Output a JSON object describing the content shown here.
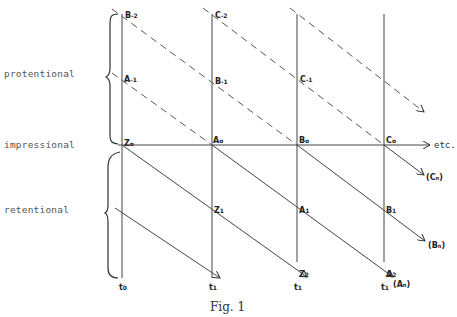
{
  "figure": {
    "caption": "Fig. 1",
    "side_labels": {
      "protentional": "protentional",
      "impressional": "impressional",
      "retentional": "retentional"
    },
    "axis_end_label": "etc.",
    "time_labels": [
      "t",
      "t",
      "t",
      "t"
    ],
    "time_subs": [
      "0",
      "1",
      "1",
      "1"
    ],
    "time_extra": "(Aₙ)",
    "points": {
      "B_m2": {
        "main": "B",
        "sub": "-2"
      },
      "C_m2": {
        "main": "C",
        "sub": "-2"
      },
      "A_m1": {
        "main": "A",
        "sub": "-1"
      },
      "B_m1": {
        "main": "B",
        "sub": "-1"
      },
      "C_m1": {
        "main": "C",
        "sub": "-1"
      },
      "Z0": {
        "main": "Z",
        "sub": "o"
      },
      "A0": {
        "main": "A",
        "sub": "o"
      },
      "B0": {
        "main": "B",
        "sub": "o"
      },
      "C0": {
        "main": "C",
        "sub": "o"
      },
      "Z1": {
        "main": "Z",
        "sub": "1"
      },
      "A1": {
        "main": "A",
        "sub": "1"
      },
      "B1": {
        "main": "B",
        "sub": "1"
      },
      "Z2": {
        "main": "Z",
        "sub": "2"
      },
      "A2": {
        "main": "A",
        "sub": "2"
      }
    },
    "arrow_labels": {
      "Cn": "(Cₙ)",
      "Bn": "(Bₙ)"
    }
  }
}
